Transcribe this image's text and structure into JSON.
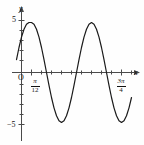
{
  "figure": {
    "axis_labels": {
      "x": "x",
      "y": "y",
      "origin": "O"
    },
    "y_ticks_labeled": [
      {
        "value": 5,
        "label": "5"
      },
      {
        "value": -5,
        "label": "−5"
      }
    ],
    "x_ticks_labeled": [
      {
        "label_numerator": "π",
        "label_denominator": "12"
      },
      {
        "label_numerator": "3π",
        "label_denominator": "4"
      }
    ],
    "curve_color": "#1a1a1a",
    "axis_color": "#444444"
  },
  "chart_data": {
    "type": "line",
    "title": "",
    "xlabel": "x",
    "ylabel": "y",
    "xlim": [
      -0.1308996939,
      2.8797932658
    ],
    "ylim": [
      -6.5,
      6.5
    ],
    "grid": false,
    "legend": "none",
    "function": "y = 5 cos(2(x - pi/12))",
    "amplitude": 5,
    "period": 3.1415926536,
    "phase_shift": 0.2617993878,
    "x_tick_values": [
      0.2617993878,
      2.3561944902
    ],
    "x_tick_labels": [
      "π/12",
      "3π/4"
    ],
    "x_tick_spacing": 0.2617993878,
    "y_tick_values": [
      -5,
      -4,
      -3,
      -2,
      -1,
      0,
      1,
      2,
      3,
      4,
      5
    ],
    "y_tick_labels": [
      "−5",
      "",
      "",
      "",
      "",
      "",
      "",
      "",
      "",
      "",
      "5"
    ],
    "key_points": [
      {
        "x": 0.2617993878,
        "y": 5,
        "kind": "maximum"
      },
      {
        "x": 1.0471975512,
        "y": -5,
        "kind": "minimum"
      },
      {
        "x": 1.8325957146,
        "y": 5,
        "kind": "maximum"
      },
      {
        "x": 0.6544984695,
        "y": 0,
        "kind": "zero"
      },
      {
        "x": 1.4398966329,
        "y": 0,
        "kind": "zero"
      },
      {
        "x": 2.2252947963,
        "y": 0,
        "kind": "zero"
      }
    ],
    "x": [
      -0.1309,
      -0.0654,
      0.0,
      0.0654,
      0.1309,
      0.1963,
      0.2618,
      0.3272,
      0.3927,
      0.4581,
      0.5236,
      0.589,
      0.6545,
      0.7199,
      0.7854,
      0.8508,
      0.9163,
      0.9817,
      1.0472,
      1.1126,
      1.1781,
      1.2435,
      1.309,
      1.3744,
      1.4399,
      1.5053,
      1.5708,
      1.6362,
      1.7017,
      1.7671,
      1.8326,
      1.898,
      1.9635,
      2.0289,
      2.0944,
      2.1598,
      2.2253,
      2.2907,
      2.3562,
      2.4216,
      2.4871,
      2.5525,
      2.618,
      2.6834,
      2.7489,
      2.8143,
      2.8798
    ],
    "y": [
      1.294,
      2.5,
      3.536,
      4.33,
      4.83,
      5.0,
      5.0,
      4.83,
      4.33,
      3.536,
      2.5,
      1.294,
      0.0,
      -1.294,
      -2.5,
      -3.536,
      -4.33,
      -4.83,
      -5.0,
      -4.83,
      -4.33,
      -3.536,
      -2.5,
      -1.294,
      0.0,
      1.294,
      2.5,
      3.536,
      4.33,
      4.83,
      5.0,
      4.83,
      4.33,
      3.536,
      2.5,
      1.294,
      0.0,
      -1.294,
      -2.5,
      -3.536,
      -4.33,
      -4.83,
      -5.0,
      -4.83,
      -4.33,
      -3.536,
      -2.5
    ]
  }
}
